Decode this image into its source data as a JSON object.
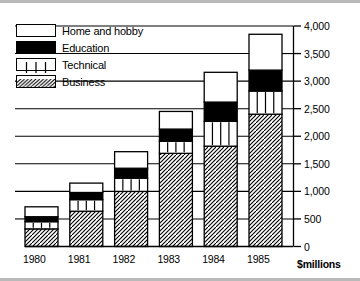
{
  "chart_data": {
    "type": "bar",
    "subtype": "stacked-bar",
    "title": "",
    "xlabel": "",
    "ylabel": "$millions",
    "axis_unit_label": "$millions",
    "categories": [
      "1980",
      "1981",
      "1982",
      "1983",
      "1984",
      "1985"
    ],
    "ylim": [
      0,
      4000
    ],
    "ytick_labels": [
      "0",
      "500",
      "1,000",
      "1,500",
      "2,000",
      "2,500",
      "3,000",
      "3,500",
      "4,000"
    ],
    "ytick_values": [
      0,
      500,
      1000,
      1500,
      2000,
      2500,
      3000,
      3500,
      4000
    ],
    "grid": "horizontal-left-of-bars",
    "legend_position": "top-left",
    "series": [
      {
        "name": "Business",
        "pattern": "diagonal-hatch",
        "values": [
          320,
          640,
          1000,
          1690,
          1820,
          2400
        ]
      },
      {
        "name": "Technical",
        "pattern": "vertical-stripes",
        "values": [
          130,
          210,
          240,
          220,
          450,
          420
        ]
      },
      {
        "name": "Education",
        "pattern": "solid-black",
        "values": [
          90,
          130,
          180,
          220,
          350,
          380
        ]
      },
      {
        "name": "Home and hobby",
        "pattern": "white",
        "values": [
          180,
          170,
          300,
          320,
          540,
          650
        ]
      }
    ],
    "totals": [
      720,
      1150,
      1720,
      2450,
      3160,
      3850
    ]
  },
  "legend": {
    "items": [
      {
        "label": "Home and hobby",
        "pattern": "white"
      },
      {
        "label": "Education",
        "pattern": "solid-black"
      },
      {
        "label": "Technical",
        "pattern": "vertical-stripes"
      },
      {
        "label": "Business",
        "pattern": "diagonal-hatch"
      }
    ]
  },
  "colors": {
    "ink": "#000000",
    "background": "#ffffff",
    "frame": "#b9b9b9"
  }
}
